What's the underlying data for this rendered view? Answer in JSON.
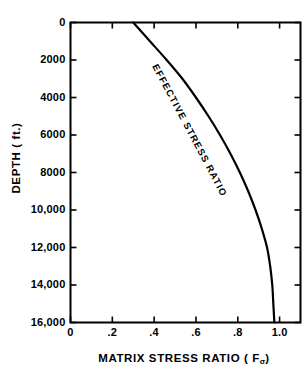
{
  "chart_data": {
    "type": "line",
    "title": "",
    "xlabel": "MATRIX STRESS RATIO ( Fσ )",
    "xlabel_main": "MATRIX STRESS RATIO ( F",
    "xlabel_sub": "σ",
    "xlabel_tail": ")",
    "ylabel": "DEPTH ( ft.)",
    "xlim": [
      0,
      1.1
    ],
    "ylim": [
      0,
      16000
    ],
    "y_inverted": true,
    "grid": false,
    "legend": "none",
    "xticks": [
      0,
      0.2,
      0.4,
      0.6,
      0.8,
      1.0
    ],
    "xtick_labels": [
      "0",
      ".2",
      ".4",
      ".6",
      ".8",
      "1.0"
    ],
    "yticks": [
      0,
      2000,
      4000,
      6000,
      8000,
      10000,
      12000,
      14000,
      16000
    ],
    "ytick_labels": [
      "0",
      "2000",
      "4000",
      "6000",
      "8000",
      "10,000",
      "12,000",
      "14,000",
      "16,000"
    ],
    "series": [
      {
        "name": "EFFECTIVE STRESS RATIO",
        "annotation": "EFFECTIVE STRESS RATIO",
        "color": "#000000",
        "x": [
          0.3,
          0.38,
          0.46,
          0.535,
          0.6,
          0.66,
          0.715,
          0.765,
          0.81,
          0.85,
          0.885,
          0.915,
          0.94
        ],
        "y": [
          0,
          1000,
          2000,
          3000,
          4000,
          5000,
          6000,
          7000,
          8000,
          9000,
          10000,
          11000,
          12000
        ],
        "x_full": [
          0.3,
          0.38,
          0.46,
          0.535,
          0.6,
          0.66,
          0.715,
          0.765,
          0.81,
          0.85,
          0.885,
          0.915,
          0.94,
          0.955,
          0.965,
          0.97,
          0.975
        ],
        "y_full": [
          0,
          1000,
          2000,
          3000,
          4000,
          5000,
          6000,
          7000,
          8000,
          9000,
          10000,
          11000,
          12000,
          13000,
          14000,
          15000,
          16000
        ]
      }
    ]
  },
  "axes": {
    "y_title": "DEPTH ( ft.)",
    "x_title_main": "MATRIX STRESS RATIO ( F",
    "x_title_sub": "σ",
    "x_title_tail": ")"
  },
  "annotations": {
    "curve_label": "EFFECTIVE STRESS RATIO"
  },
  "colors": {
    "background": "#ffffff",
    "ink": "#000000",
    "curve": "#000000"
  }
}
